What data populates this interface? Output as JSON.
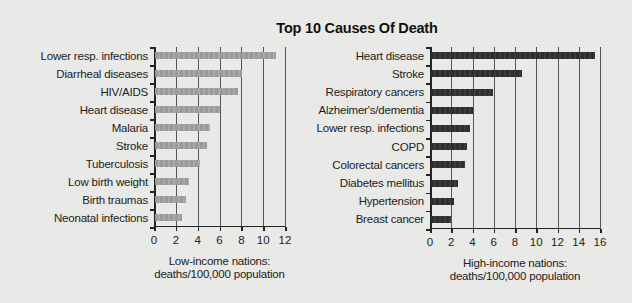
{
  "title": "Top 10 Causes Of Death",
  "chart_data": [
    {
      "type": "bar",
      "orientation": "horizontal",
      "title": "Top 10 Causes Of Death",
      "xlabel": "Low-income nations: deaths/100,000 population",
      "xlabel_lines": [
        "Low-income nations:",
        "deaths/100,000 population"
      ],
      "ylabel": "",
      "categories": [
        "Lower resp. infections",
        "Diarrheal diseases",
        "HIV/AIDS",
        "Heart disease",
        "Malaria",
        "Stroke",
        "Tuberculosis",
        "Low birth weight",
        "Birth traumas",
        "Neonatal infections"
      ],
      "values": [
        11.2,
        8.1,
        7.7,
        6.0,
        5.1,
        4.9,
        4.2,
        3.2,
        2.9,
        2.6
      ],
      "xlim": [
        0,
        12
      ],
      "xticks": [
        "0",
        "2",
        "4",
        "6",
        "8",
        "10",
        "12"
      ],
      "grid": "vertical",
      "bar_color": "#9f9f9d"
    },
    {
      "type": "bar",
      "orientation": "horizontal",
      "title": "Top 10 Causes Of Death",
      "xlabel": "High-income nations: deaths/100,000 population",
      "xlabel_lines": [
        "High-income nations:",
        "deaths/100,000 population"
      ],
      "ylabel": "",
      "categories": [
        "Heart disease",
        "Stroke",
        "Respiratory cancers",
        "Alzheimer's/dementia",
        "Lower resp. infections",
        "COPD",
        "Colorectal cancers",
        "Diabetes mellitus",
        "Hypertension",
        "Breast cancer"
      ],
      "values": [
        15.5,
        8.7,
        5.9,
        4.0,
        3.8,
        3.5,
        3.3,
        2.6,
        2.3,
        2.0
      ],
      "xlim": [
        0,
        16
      ],
      "xticks": [
        "0",
        "2",
        "4",
        "6",
        "8",
        "10",
        "12",
        "14",
        "16"
      ],
      "grid": "vertical",
      "bar_color": "#333333"
    }
  ]
}
